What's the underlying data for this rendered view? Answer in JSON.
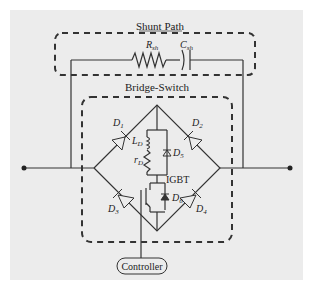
{
  "diagram": {
    "type": "circuit",
    "groups": {
      "shunt_path": {
        "title": "Shunt Path",
        "resistor": "R",
        "resistor_sub": "sh",
        "capacitor": "C",
        "capacitor_sub": "sh"
      },
      "bridge_switch": {
        "title": "Bridge-Switch"
      }
    },
    "components": {
      "d1": {
        "label": "D",
        "sub": "1"
      },
      "d2": {
        "label": "D",
        "sub": "2"
      },
      "d3": {
        "label": "D",
        "sub": "3"
      },
      "d4": {
        "label": "D",
        "sub": "4"
      },
      "d5": {
        "label": "D",
        "sub": "5"
      },
      "d6": {
        "label": "D",
        "sub": "6"
      },
      "ld": {
        "label": "L",
        "sub": "D"
      },
      "rd": {
        "label": "r",
        "sub": "D"
      },
      "igbt": {
        "label": "IGBT"
      }
    },
    "controller": {
      "label": "Controller"
    },
    "colors": {
      "background": "#ececec",
      "line": "#333333"
    }
  }
}
